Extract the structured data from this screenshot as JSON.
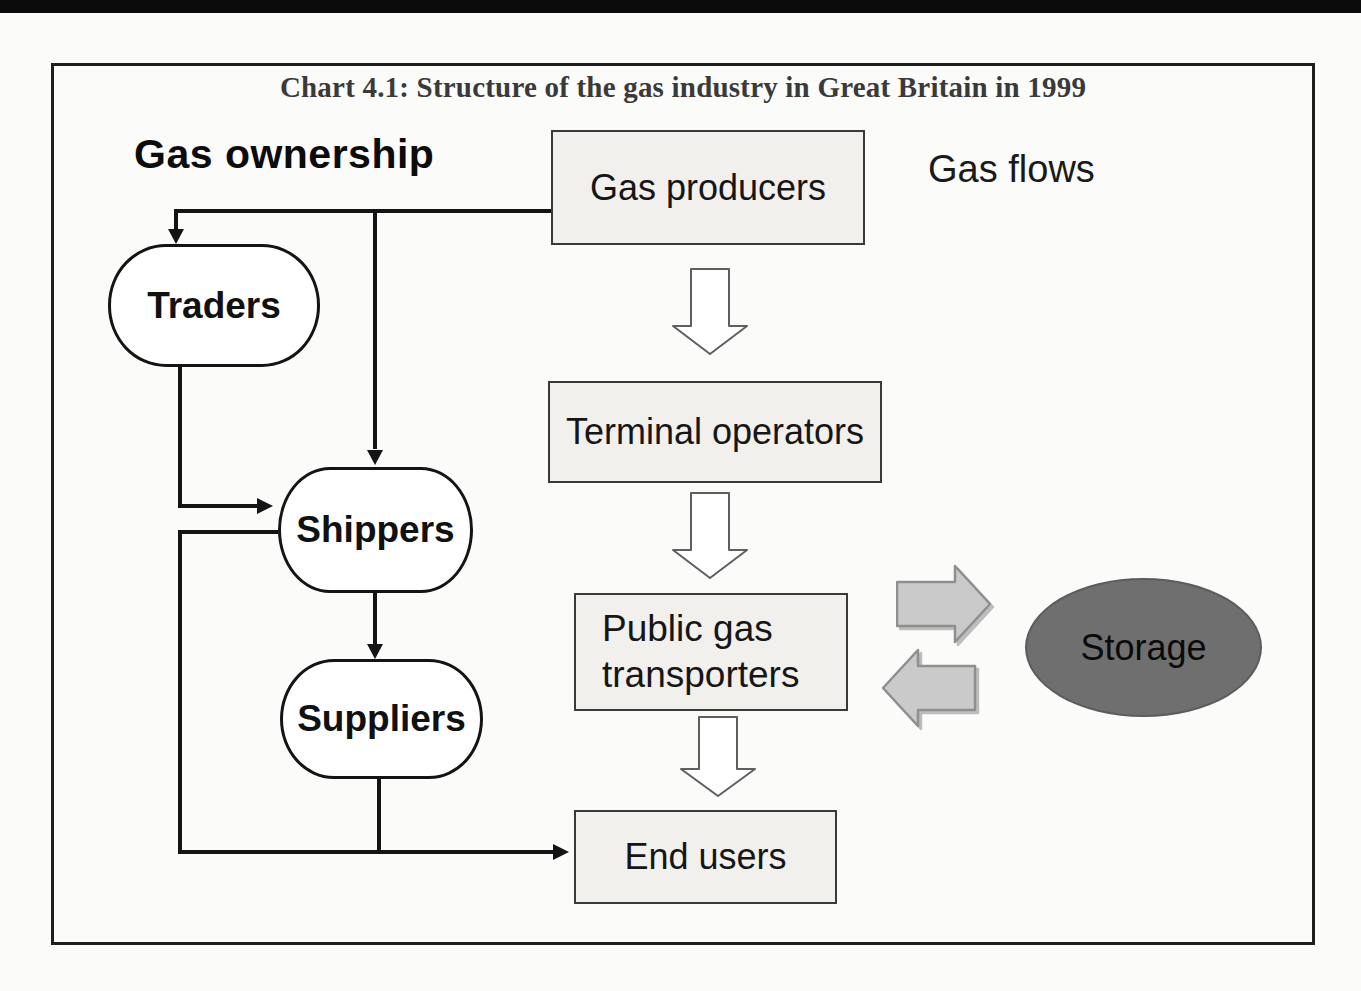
{
  "title": "Chart 4.1: Structure of the gas industry in Great Britain in 1999",
  "legend": {
    "ownership": "Gas ownership",
    "flows": "Gas flows"
  },
  "nodes": {
    "gas_producers": {
      "label": "Gas producers",
      "shape": "box"
    },
    "terminal_operators": {
      "label": "Terminal operators",
      "shape": "box"
    },
    "public_gas_transporters": {
      "label_line1": "Public gas",
      "label_line2": "transporters",
      "shape": "box"
    },
    "end_users": {
      "label": "End users",
      "shape": "box"
    },
    "traders": {
      "label": "Traders",
      "shape": "rounded"
    },
    "shippers": {
      "label": "Shippers",
      "shape": "rounded"
    },
    "suppliers": {
      "label": "Suppliers",
      "shape": "rounded"
    },
    "storage": {
      "label": "Storage",
      "shape": "ellipse"
    }
  },
  "edges": [
    {
      "from": "gas_producers",
      "to": "traders",
      "kind": "ownership-line"
    },
    {
      "from": "gas_producers",
      "to": "shippers",
      "kind": "ownership-line"
    },
    {
      "from": "traders",
      "to": "shippers",
      "kind": "ownership-line"
    },
    {
      "from": "shippers",
      "to": "suppliers",
      "kind": "ownership-line"
    },
    {
      "from": "shippers",
      "to": "end_users",
      "kind": "ownership-line"
    },
    {
      "from": "suppliers",
      "to": "end_users",
      "kind": "ownership-line"
    },
    {
      "from": "gas_producers",
      "to": "terminal_operators",
      "kind": "flow-outline-arrow"
    },
    {
      "from": "terminal_operators",
      "to": "public_gas_transporters",
      "kind": "flow-outline-arrow"
    },
    {
      "from": "public_gas_transporters",
      "to": "end_users",
      "kind": "flow-outline-arrow"
    },
    {
      "from": "public_gas_transporters",
      "to": "storage",
      "kind": "flow-block-arrow"
    },
    {
      "from": "storage",
      "to": "public_gas_transporters",
      "kind": "flow-block-arrow"
    }
  ],
  "colors": {
    "paper": "#fbfbfa",
    "frame_border": "#1f1f1f",
    "box_fill": "#f1f0ed",
    "box_border": "#3a3a3a",
    "rounded_fill": "#ffffff",
    "line": "#141414",
    "outline_arrow_fill": "#ffffff",
    "outline_arrow_stroke": "#5f5f5f",
    "block_arrow_fill": "#cacaca",
    "block_arrow_stroke": "#8f8f8f",
    "storage_fill": "#6f6f6f",
    "title_color": "#3a3a3a"
  }
}
